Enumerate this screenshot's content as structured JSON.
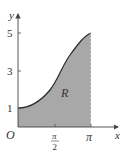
{
  "diagram": {
    "axes": {
      "x_label": "x",
      "y_label": "y",
      "origin_label": "O",
      "y_ticks": [
        "1",
        "3",
        "5"
      ],
      "x_ticks": [
        {
          "num": "π",
          "den": "2"
        },
        {
          "num": "π"
        }
      ]
    },
    "region_label": "R",
    "curve": {
      "description": "increasing curve from (0,1) through (π/2,3) to (π,5)",
      "points": [
        [
          0,
          1
        ],
        [
          1.5708,
          3
        ],
        [
          3.1416,
          5
        ]
      ]
    },
    "colors": {
      "fill": "#a8a8a8",
      "curve": "#2a2a2a",
      "axis": "#555555"
    }
  }
}
